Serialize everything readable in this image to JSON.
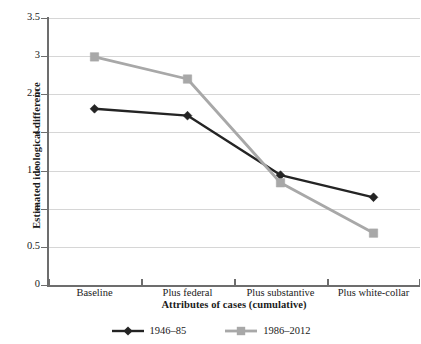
{
  "chart_data": {
    "type": "line",
    "title": "",
    "xlabel": "Attributes of cases (cumulative)",
    "ylabel": "Estimated ideological difference",
    "categories": [
      "Baseline",
      "Plus federal",
      "Plus substantive",
      "Plus white-collar"
    ],
    "series": [
      {
        "name": "1946–85",
        "color": "#242424",
        "marker": "diamond",
        "values": [
          2.31,
          2.22,
          1.44,
          1.15
        ]
      },
      {
        "name": "1986–2012",
        "color": "#a8a8a8",
        "marker": "square",
        "values": [
          2.99,
          2.7,
          1.34,
          0.68
        ]
      }
    ],
    "ylim": [
      0,
      3.5
    ],
    "yticks": [
      0,
      0.5,
      1,
      1.5,
      2,
      2.5,
      3,
      3.5
    ],
    "ytick_labels": [
      "0",
      "0.5",
      "1",
      "1.5",
      "2",
      "2.5",
      "3",
      "3.5"
    ],
    "grid": true,
    "legend_position": "bottom"
  },
  "legend": {
    "entries": [
      {
        "label": "1946–85"
      },
      {
        "label": "1986–2012"
      }
    ]
  },
  "colors": {
    "series_1": "#242424",
    "series_2": "#a8a8a8",
    "gridline": "#d6d6d6",
    "axis": "#6d6d6d",
    "background": "#ffffff"
  }
}
